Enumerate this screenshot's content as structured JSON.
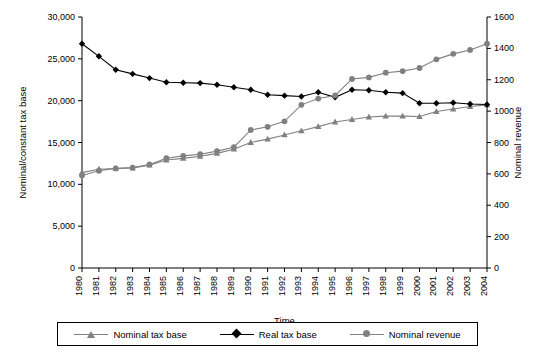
{
  "chart_data": {
    "type": "line",
    "title": "",
    "xlabel": "Time",
    "ylabel": "Nominal/constant tax base",
    "y2label": "Nominal revenue",
    "categories": [
      "1980",
      "1981",
      "1982",
      "1983",
      "1984",
      "1985",
      "1986",
      "1987",
      "1988",
      "1989",
      "1990",
      "1991",
      "1992",
      "1993",
      "1994",
      "1995",
      "1996",
      "1997",
      "1998",
      "1999",
      "2000",
      "2001",
      "2002",
      "2003",
      "2004"
    ],
    "ylim": [
      0,
      30000
    ],
    "yticks": [
      "0",
      "5,000",
      "10,000",
      "15,000",
      "20,000",
      "25,000",
      "30,000"
    ],
    "y2lim": [
      0,
      1600
    ],
    "y2ticks": [
      "0",
      "200",
      "400",
      "600",
      "800",
      "1000",
      "1200",
      "1400",
      "1600"
    ],
    "grid": false,
    "legend_position": "bottom",
    "series": [
      {
        "name": "Nominal tax base",
        "axis": "left",
        "marker": "triangle",
        "color": "#808080",
        "values": [
          11400,
          11800,
          11900,
          11950,
          12300,
          12900,
          13100,
          13350,
          13700,
          14200,
          15000,
          15400,
          15900,
          16400,
          16900,
          17450,
          17750,
          18050,
          18150,
          18150,
          18100,
          18700,
          19000,
          19300,
          19500
        ]
      },
      {
        "name": "Real tax base",
        "axis": "left",
        "marker": "diamond",
        "color": "#000000",
        "values": [
          26800,
          25300,
          23700,
          23200,
          22700,
          22200,
          22150,
          22100,
          21900,
          21600,
          21300,
          20700,
          20600,
          20500,
          21000,
          20400,
          21300,
          21250,
          21000,
          20900,
          19700,
          19700,
          19750,
          19600,
          19550
        ]
      },
      {
        "name": "Nominal revenue",
        "axis": "right",
        "marker": "circle",
        "color": "#808080",
        "values": [
          590,
          620,
          635,
          640,
          660,
          700,
          715,
          725,
          745,
          770,
          880,
          900,
          935,
          1040,
          1080,
          1100,
          1205,
          1215,
          1245,
          1255,
          1275,
          1330,
          1365,
          1390,
          1430
        ]
      }
    ]
  },
  "legend": {
    "items": [
      {
        "label": "Nominal tax base",
        "marker": "triangle-icon",
        "color": "#808080"
      },
      {
        "label": "Real tax base",
        "marker": "diamond-icon",
        "color": "#000000"
      },
      {
        "label": "Nominal revenue",
        "marker": "circle-icon",
        "color": "#808080"
      }
    ]
  }
}
